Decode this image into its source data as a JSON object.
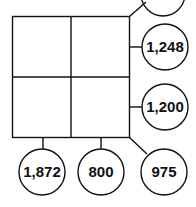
{
  "diagram": {
    "grid": {
      "rows": 2,
      "cols": 2,
      "cells": [
        "",
        "",
        "",
        ""
      ]
    },
    "circles": {
      "top_diagonal": "",
      "row1_sum": "1,248",
      "row2_sum": "1,200",
      "col1_sum": "1,872",
      "col2_sum": "800",
      "bottom_diagonal": "975"
    }
  }
}
